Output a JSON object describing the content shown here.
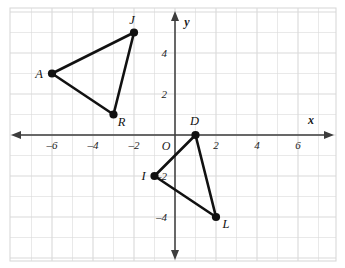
{
  "figure": {
    "type": "coordinate-plane",
    "background_color": "#ffffff",
    "grid_color": "#d9d9d9",
    "axis_color": "#3d3d3d",
    "shape_color": "#111111"
  },
  "axes": {
    "x_label": "x",
    "y_label": "y",
    "origin_label": "O",
    "x_range": [
      -7.8,
      7.7
    ],
    "y_range": [
      -6.0,
      6.0
    ],
    "x_ticks": [
      {
        "value": -6,
        "label": "–6"
      },
      {
        "value": -4,
        "label": "–4"
      },
      {
        "value": -2,
        "label": "–2"
      },
      {
        "value": 2,
        "label": "2"
      },
      {
        "value": 4,
        "label": "4"
      },
      {
        "value": 6,
        "label": "6"
      }
    ],
    "y_ticks": [
      {
        "value": 4,
        "label": "4"
      },
      {
        "value": 2,
        "label": "2"
      },
      {
        "value": -2,
        "label": "–2"
      },
      {
        "value": -4,
        "label": "–4"
      }
    ],
    "grid_spacing_units": 1,
    "grid_major_spacing_units": 2
  },
  "chart_data": {
    "type": "scatter",
    "title": "",
    "xlabel": "x",
    "ylabel": "y",
    "xlim": [
      -7.8,
      7.7
    ],
    "ylim": [
      -6.0,
      6.0
    ],
    "grid": true,
    "legend": "none",
    "shapes": [
      {
        "name": "triangle-ajr",
        "closed": true,
        "vertices": [
          {
            "label": "A",
            "x": -6,
            "y": 3,
            "label_dx": -13,
            "label_dy": 4
          },
          {
            "label": "J",
            "x": -2,
            "y": 5,
            "label_dx": -2,
            "label_dy": -9
          },
          {
            "label": "R",
            "x": -3,
            "y": 1,
            "label_dx": 8,
            "label_dy": 11
          }
        ]
      },
      {
        "name": "triangle-dil",
        "closed": true,
        "vertices": [
          {
            "label": "D",
            "x": 1,
            "y": 0,
            "label_dx": -1,
            "label_dy": -10
          },
          {
            "label": "I",
            "x": -1,
            "y": -2,
            "label_dx": -11,
            "label_dy": 4
          },
          {
            "label": "L",
            "x": 2,
            "y": -4,
            "label_dx": 10,
            "label_dy": 11
          }
        ]
      }
    ]
  }
}
